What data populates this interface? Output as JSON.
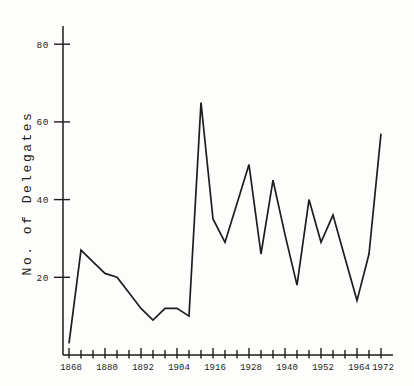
{
  "page": {
    "paper_color": "#fdfdfc",
    "ink_color": "#1d1d1d"
  },
  "chart_data": {
    "type": "line",
    "title": "",
    "xlabel": "",
    "ylabel": "No. of Delegates",
    "grid": false,
    "legend": "none",
    "line_color": "#1d1d1d",
    "ylim": [
      0,
      85
    ],
    "xlim": [
      1868,
      1976
    ],
    "y_ticks": [
      20,
      40,
      60,
      80
    ],
    "y_tick_labels": [
      "20",
      "40",
      "60",
      "80"
    ],
    "x_labeled_ticks": [
      1868,
      1880,
      1892,
      1904,
      1916,
      1928,
      1940,
      1952,
      1964,
      1972
    ],
    "x_tick_labels": [
      "1868",
      "1880",
      "1892",
      "1904",
      "1916",
      "1928",
      "1940",
      "1952",
      "1964",
      "1972"
    ],
    "x_minor_tick_step": 4,
    "x": [
      1868,
      1872,
      1876,
      1880,
      1884,
      1888,
      1892,
      1896,
      1900,
      1904,
      1908,
      1912,
      1916,
      1920,
      1924,
      1928,
      1932,
      1936,
      1940,
      1944,
      1948,
      1952,
      1956,
      1960,
      1964,
      1968,
      1972
    ],
    "series": [
      {
        "name": "No. of Delegates",
        "values": [
          3,
          27,
          24,
          21,
          20,
          16,
          12,
          9,
          12,
          12,
          10,
          65,
          35,
          29,
          39,
          49,
          26,
          45,
          31,
          18,
          40,
          29,
          36,
          25,
          14,
          26,
          57
        ]
      }
    ]
  }
}
